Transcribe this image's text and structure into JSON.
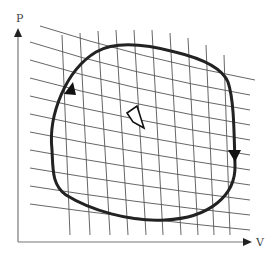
{
  "diagram": {
    "title": "",
    "type": "pv-cycle-with-grid",
    "axes": {
      "y_label": "P",
      "x_label": "V"
    },
    "cycle": {
      "direction": "clockwise",
      "arrow_left": "up",
      "arrow_right": "down"
    },
    "highlighted_cell": "center-diamond",
    "colors": {
      "loop": "#222222",
      "grid": "#555555",
      "axes": "#777777",
      "background": "#ffffff"
    }
  }
}
